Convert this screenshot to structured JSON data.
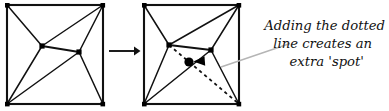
{
  "figure": {
    "colors": {
      "stroke": "#111111",
      "node": "#000000",
      "leader_line": "#b5b5b5",
      "background": "#ffffff"
    },
    "annotation": {
      "lines": [
        "Adding the dotted",
        "line creates an",
        "extra 'spot'"
      ],
      "line1": "Adding the dotted",
      "line2": "line creates an",
      "line3": "extra 'spot'"
    },
    "left_graph": {
      "label": "original graph",
      "square": {
        "left": 7,
        "top": 5,
        "right": 103,
        "bottom": 104
      },
      "nodes": [
        {
          "name": "top-left-corner",
          "x": 7,
          "y": 5
        },
        {
          "name": "top-right-corner",
          "x": 103,
          "y": 5
        },
        {
          "name": "bottom-left-corner",
          "x": 7,
          "y": 104
        },
        {
          "name": "bottom-right-corner",
          "x": 103,
          "y": 104
        },
        {
          "name": "left-interior-node",
          "x": 42,
          "y": 46
        },
        {
          "name": "right-interior-node",
          "x": 79,
          "y": 52
        }
      ],
      "edges": [
        [
          "top-left-corner",
          "left-interior-node"
        ],
        [
          "top-right-corner",
          "left-interior-node"
        ],
        [
          "top-right-corner",
          "right-interior-node"
        ],
        [
          "left-interior-node",
          "right-interior-node"
        ],
        [
          "left-interior-node",
          "bottom-left-corner"
        ],
        [
          "bottom-left-corner",
          "right-interior-node"
        ],
        [
          "right-interior-node",
          "bottom-right-corner"
        ]
      ]
    },
    "right_graph": {
      "label": "graph with added dotted line",
      "square": {
        "left": 144,
        "top": 5,
        "right": 239,
        "bottom": 104
      },
      "nodes": [
        {
          "name": "top-left-corner",
          "x": 144,
          "y": 5
        },
        {
          "name": "top-right-corner",
          "x": 239,
          "y": 5
        },
        {
          "name": "bottom-left-corner",
          "x": 144,
          "y": 104
        },
        {
          "name": "bottom-right-corner",
          "x": 239,
          "y": 104
        },
        {
          "name": "left-interior-node",
          "x": 169,
          "y": 45
        },
        {
          "name": "right-interior-node",
          "x": 211,
          "y": 50
        },
        {
          "name": "new-spot-node",
          "x": 189,
          "y": 62
        }
      ],
      "edges": [
        [
          "top-left-corner",
          "left-interior-node"
        ],
        [
          "top-right-corner",
          "left-interior-node"
        ],
        [
          "top-right-corner",
          "right-interior-node"
        ],
        [
          "left-interior-node",
          "right-interior-node"
        ],
        [
          "left-interior-node",
          "bottom-left-corner"
        ],
        [
          "bottom-left-corner",
          "right-interior-node"
        ],
        [
          "right-interior-node",
          "bottom-right-corner"
        ]
      ],
      "dotted_edge": [
        "left-interior-node",
        "bottom-right-corner"
      ],
      "new_spot_label": "extra spot"
    },
    "transform_arrow": {
      "x1": 109,
      "y1": 51,
      "x2": 139,
      "y2": 51
    },
    "pointer_arrow": {
      "x1": 203,
      "y1": 61,
      "x2": 193,
      "y2": 62
    },
    "leader_line": {
      "x1": 221,
      "y1": 66,
      "x2": 288,
      "y2": 44
    }
  }
}
